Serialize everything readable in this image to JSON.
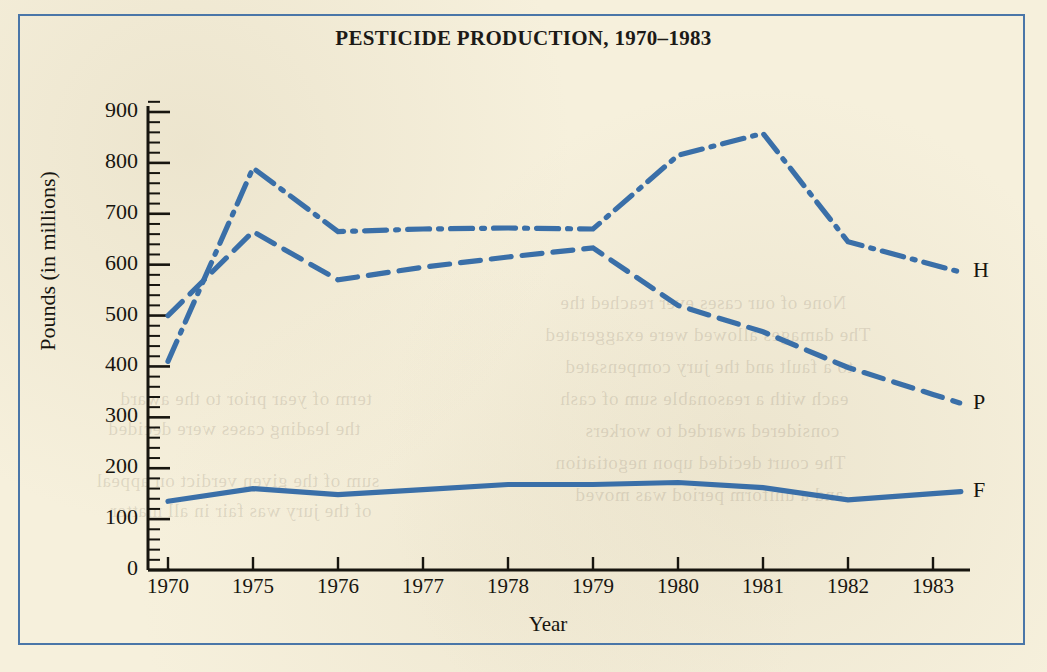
{
  "page": {
    "background_color": "#f6f0dc",
    "frame_color": "#4a76a8",
    "ink_color": "#17150f",
    "series_color": "#3a6fa8"
  },
  "chart_data": {
    "type": "line",
    "title": "PESTICIDE PRODUCTION, 1970–1983",
    "xlabel": "Year",
    "ylabel": "Pounds (in millions)",
    "categories": [
      "1970",
      "1975",
      "1976",
      "1977",
      "1978",
      "1979",
      "1980",
      "1981",
      "1982",
      "1983"
    ],
    "ylim": [
      0,
      900
    ],
    "yticks": [
      0,
      100,
      200,
      300,
      400,
      500,
      600,
      700,
      800,
      900
    ],
    "ytick_labels": [
      "0",
      "100",
      "200",
      "300",
      "400",
      "500",
      "600",
      "700",
      "800",
      "900"
    ],
    "minor_ticks_per_interval": 5,
    "grid": false,
    "legend_position": "right-inline",
    "series": [
      {
        "name": "H",
        "label": "H",
        "style": "dash-dot",
        "values": [
          410,
          790,
          665,
          670,
          672,
          670,
          815,
          858,
          645,
          600
        ]
      },
      {
        "name": "P",
        "label": "P",
        "style": "dashed",
        "values": [
          500,
          665,
          570,
          595,
          615,
          633,
          520,
          468,
          398,
          345
        ]
      },
      {
        "name": "F",
        "label": "F",
        "style": "solid",
        "values": [
          135,
          160,
          148,
          158,
          168,
          168,
          172,
          162,
          138,
          150
        ]
      }
    ]
  },
  "bleed_text": [
    {
      "text": "None of our cases ever reached the",
      "x": 560,
      "y": 292
    },
    {
      "text": "The damages allowed were exaggerated",
      "x": 545,
      "y": 324
    },
    {
      "text": "to a fault and the jury compensated",
      "x": 565,
      "y": 356
    },
    {
      "text": "each with a reasonable sum of cash",
      "x": 560,
      "y": 388
    },
    {
      "text": "considered awarded to workers",
      "x": 585,
      "y": 420
    },
    {
      "text": "The court decided upon negotiation",
      "x": 555,
      "y": 452
    },
    {
      "text": "and a uniform period was moved",
      "x": 575,
      "y": 484
    },
    {
      "text": "sum of the given verdict on appeal",
      "x": 96,
      "y": 470
    },
    {
      "text": "of the jury was fair in all matter",
      "x": 110,
      "y": 500
    },
    {
      "text": "term of year prior to the award",
      "x": 120,
      "y": 388
    },
    {
      "text": "the leading cases were decided",
      "x": 108,
      "y": 418
    }
  ]
}
